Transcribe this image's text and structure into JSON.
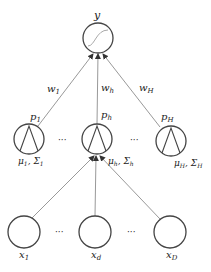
{
  "diagram": {
    "output_node": {
      "label": "y",
      "icon": "sigmoid-icon"
    },
    "hidden_nodes": [
      {
        "label_top": "p",
        "sub_top": "1",
        "label_bottom": "μ",
        "sub_bottom_mu": "1",
        "sigma": "Σ",
        "sub_bottom_sigma": "1",
        "weight": "w",
        "weight_sub": "1"
      },
      {
        "label_top": "p",
        "sub_top": "h",
        "label_bottom": "μ",
        "sub_bottom_mu": "h",
        "sigma": "Σ",
        "sub_bottom_sigma": "h",
        "weight": "w",
        "weight_sub": "h"
      },
      {
        "label_top": "p",
        "sub_top": "H",
        "label_bottom": "μ",
        "sub_bottom_mu": "H",
        "sigma": "Σ",
        "sub_bottom_sigma": "H",
        "weight": "w",
        "weight_sub": "H"
      }
    ],
    "input_nodes": [
      {
        "label": "x",
        "sub": "1"
      },
      {
        "label": "x",
        "sub": "d"
      },
      {
        "label": "x",
        "sub": "D"
      }
    ],
    "ellipsis": "···",
    "colors": {
      "stroke": "#444444",
      "edge": "#888888",
      "text": "#222222"
    }
  }
}
